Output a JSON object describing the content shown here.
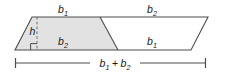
{
  "figure": {
    "shape": "parallelogram",
    "colors": {
      "stroke": "#4d4d4d",
      "shaded_fill": "#e2e2e2",
      "unshaded_fill": "#ffffff",
      "text": "#1a1a1a",
      "background": "#ffffff"
    },
    "labels": {
      "top_left": {
        "base": "b",
        "sub": "1",
        "text": "b1"
      },
      "top_right": {
        "base": "b",
        "sub": "2",
        "text": "b2"
      },
      "inner_left": {
        "base": "b",
        "sub": "2",
        "text": "b2"
      },
      "inner_right": {
        "base": "b",
        "sub": "1",
        "text": "b1"
      },
      "height": {
        "base": "h",
        "sub": "",
        "text": "h"
      },
      "dimension": {
        "left": "b",
        "left_sub": "1",
        "operator": "+",
        "right": "b",
        "right_sub": "2",
        "text": "b1 + b2"
      }
    },
    "geometry": {
      "parallelogram": {
        "top_left": [
          32,
          17
        ],
        "top_right": [
          208,
          17
        ],
        "bottom_right": [
          191,
          50
        ],
        "bottom_left": [
          15,
          50
        ]
      },
      "diagonal": {
        "from": [
          100,
          17
        ],
        "to": [
          118,
          50
        ]
      },
      "height_line": {
        "from": [
          37,
          17
        ],
        "to": [
          37,
          50
        ],
        "style": "dashed"
      },
      "right_angle_marker": {
        "corner": [
          37,
          50
        ],
        "size": 6
      },
      "dimension_line": {
        "y": 63,
        "from_x": 15,
        "to_x": 206,
        "tick_height": 10
      }
    }
  }
}
